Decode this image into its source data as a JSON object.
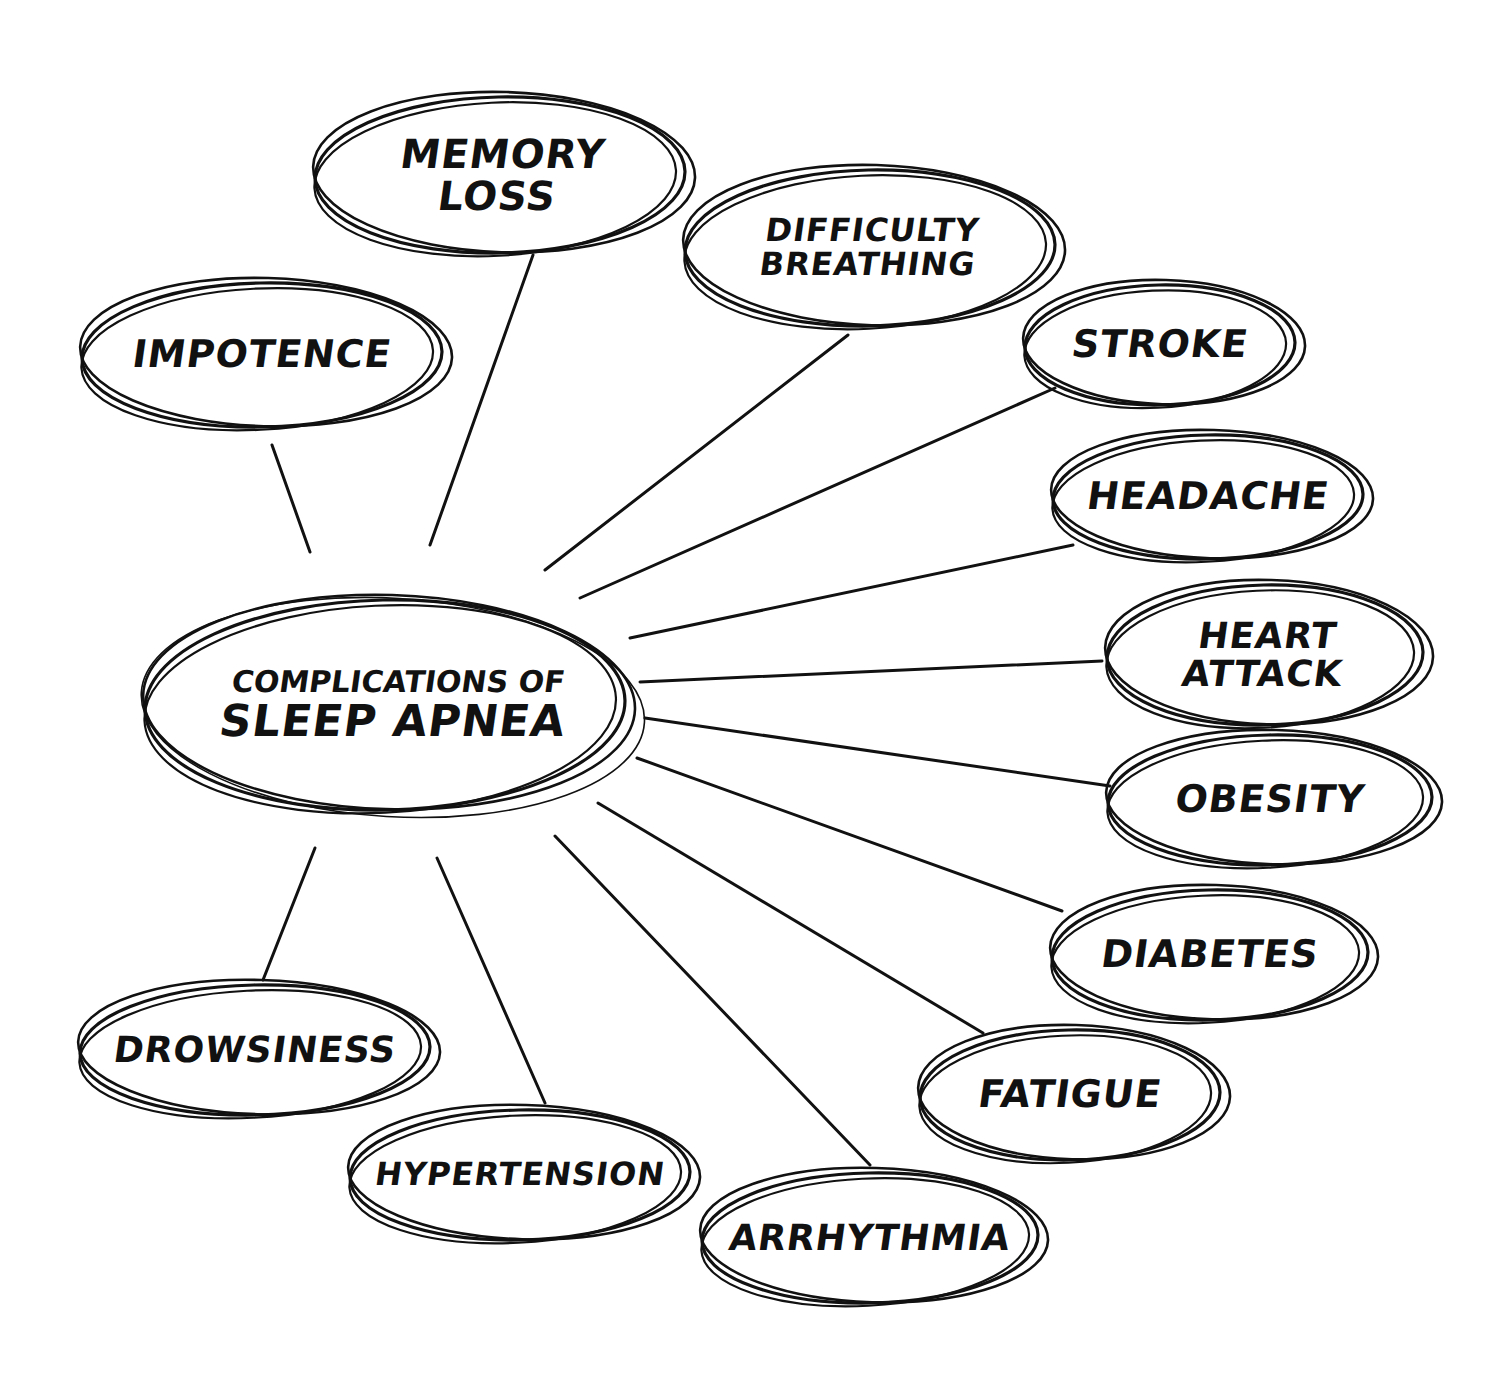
{
  "diagram": {
    "type": "mind-map",
    "style": "hand-drawn sketch, black ink on white",
    "colors": {
      "ink": "#111111",
      "background": "#ffffff"
    },
    "center": {
      "line1": "Complications of",
      "line2": "Sleep Apnea",
      "cx": 385,
      "cy": 705,
      "rx": 240,
      "ry": 105
    },
    "nodes": [
      {
        "id": "impotence",
        "lines": [
          "IMPOTENCE"
        ],
        "cx": 262,
        "cy": 355,
        "rx": 180,
        "ry": 72,
        "font": 38,
        "anchor": [
          272,
          445
        ],
        "edge_end": [
          310,
          552
        ]
      },
      {
        "id": "memory-loss",
        "lines": [
          "MEMORY",
          "LOSS"
        ],
        "cx": 500,
        "cy": 175,
        "rx": 185,
        "ry": 78,
        "font": 40,
        "anchor": [
          533,
          255
        ],
        "edge_end": [
          430,
          545
        ]
      },
      {
        "id": "difficulty-breathing",
        "lines": [
          "DIFFICULTY",
          "BREATHING"
        ],
        "cx": 870,
        "cy": 248,
        "rx": 185,
        "ry": 78,
        "font": 32,
        "anchor": [
          848,
          335
        ],
        "edge_end": [
          545,
          570
        ]
      },
      {
        "id": "stroke",
        "lines": [
          "STROKE"
        ],
        "cx": 1160,
        "cy": 345,
        "rx": 135,
        "ry": 60,
        "font": 38,
        "anchor": [
          1055,
          388
        ],
        "edge_end": [
          580,
          598
        ]
      },
      {
        "id": "headache",
        "lines": [
          "HEADACHE"
        ],
        "cx": 1208,
        "cy": 497,
        "rx": 155,
        "ry": 62,
        "font": 38,
        "anchor": [
          1073,
          545
        ],
        "edge_end": [
          630,
          638
        ]
      },
      {
        "id": "heart-attack",
        "lines": [
          "HEART",
          "ATTACK"
        ],
        "cx": 1265,
        "cy": 655,
        "rx": 158,
        "ry": 70,
        "font": 36,
        "anchor": [
          1102,
          661
        ],
        "edge_end": [
          640,
          682
        ]
      },
      {
        "id": "obesity",
        "lines": [
          "OBESITY"
        ],
        "cx": 1270,
        "cy": 800,
        "rx": 162,
        "ry": 65,
        "font": 38,
        "anchor": [
          1110,
          786
        ],
        "edge_end": [
          645,
          718
        ]
      },
      {
        "id": "diabetes",
        "lines": [
          "DIABETES"
        ],
        "cx": 1210,
        "cy": 955,
        "rx": 158,
        "ry": 65,
        "font": 38,
        "anchor": [
          1062,
          911
        ],
        "edge_end": [
          637,
          758
        ]
      },
      {
        "id": "fatigue",
        "lines": [
          "FATIGUE"
        ],
        "cx": 1070,
        "cy": 1095,
        "rx": 150,
        "ry": 65,
        "font": 38,
        "anchor": [
          983,
          1033
        ],
        "edge_end": [
          598,
          803
        ]
      },
      {
        "id": "arrhythmia",
        "lines": [
          "ARRHYTHMIA"
        ],
        "cx": 870,
        "cy": 1238,
        "rx": 168,
        "ry": 65,
        "font": 36,
        "anchor": [
          870,
          1165
        ],
        "edge_end": [
          555,
          836
        ]
      },
      {
        "id": "hypertension",
        "lines": [
          "HYPERTENSION"
        ],
        "cx": 520,
        "cy": 1175,
        "rx": 170,
        "ry": 65,
        "font": 32,
        "anchor": [
          545,
          1103
        ],
        "edge_end": [
          437,
          858
        ]
      },
      {
        "id": "drowsiness",
        "lines": [
          "DROWSINESS"
        ],
        "cx": 255,
        "cy": 1050,
        "rx": 175,
        "ry": 65,
        "font": 36,
        "anchor": [
          263,
          980
        ],
        "edge_end": [
          315,
          848
        ]
      }
    ]
  }
}
